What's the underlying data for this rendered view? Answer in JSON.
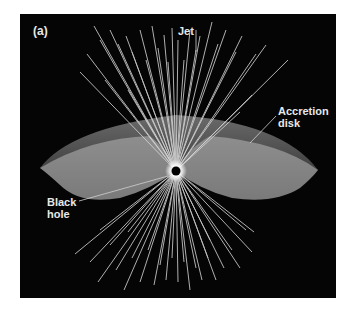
{
  "figure": {
    "panel_label": "(a)",
    "labels": {
      "jet": "Jet",
      "accretion_disk_line1": "Accretion",
      "accretion_disk_line2": "disk",
      "black_hole_line1": "Black",
      "black_hole_line2": "hole"
    },
    "colors": {
      "background": "#050505",
      "disk_rim": "#5a5a5a",
      "disk_surface": "#8a8a8a",
      "jet_lines": "#d8d8d8",
      "label_text": "#e8e8e8"
    },
    "center": {
      "x": 176,
      "y": 171
    }
  }
}
